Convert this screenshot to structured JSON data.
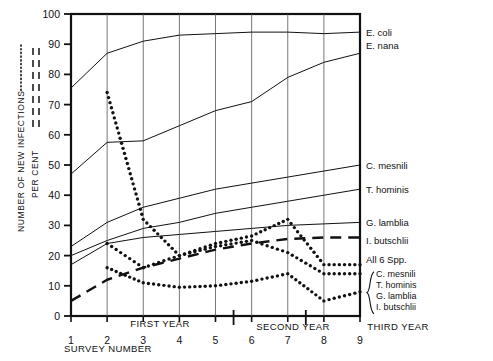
{
  "axes": {
    "y_label_primary": "NUMBER OF NEW INFECTIONS",
    "y_label_secondary": "PER CENT",
    "y_ticks": [
      "0",
      "10",
      "20",
      "30",
      "40",
      "50",
      "60",
      "70",
      "80",
      "90",
      "100"
    ],
    "x_label": "SURVEY  NUMBER",
    "x_ticks": [
      "1",
      "2",
      "3",
      "4",
      "5",
      "6",
      "7",
      "8",
      "9"
    ],
    "period_first": "FIRST  YEAR",
    "period_second": "SECOND  YEAR",
    "period_third": "THIRD  YEAR"
  },
  "right_labels": {
    "e_coli": "E. coli",
    "e_nana": "E. nana",
    "c_mesnili": "C. mesnili",
    "t_hominis": "T. hominis",
    "g_lamblia": "G. lamblia",
    "i_butschlii": "I. butschlii",
    "all_six": "All 6 Spp.",
    "bracket": [
      "C. mesnili",
      "T. hominis",
      "G. lamblia",
      "I. butschlii"
    ]
  },
  "chart_data": {
    "type": "line",
    "title": "",
    "xlabel": "SURVEY  NUMBER",
    "ylabel": "NUMBER OF NEW INFECTIONS / PER CENT",
    "xlim": [
      1,
      9
    ],
    "ylim": [
      0,
      100
    ],
    "grid": true,
    "legend_position": "right-inline",
    "x": [
      1,
      2,
      3,
      4,
      5,
      6,
      7,
      8,
      9
    ],
    "series": [
      {
        "name": "E. coli",
        "style": "solid",
        "values": [
          75.5,
          87,
          91,
          93,
          93.5,
          94,
          94,
          93.5,
          94
        ]
      },
      {
        "name": "E. nana",
        "style": "solid",
        "values": [
          47,
          57.5,
          58,
          63,
          68,
          71,
          79,
          84,
          87
        ]
      },
      {
        "name": "C. mesnili",
        "style": "solid",
        "values": [
          23,
          31,
          36,
          39,
          42,
          44,
          46,
          48,
          50
        ]
      },
      {
        "name": "T. hominis",
        "style": "solid",
        "values": [
          20,
          25,
          29,
          31,
          34,
          36,
          38,
          40,
          42
        ]
      },
      {
        "name": "G. lamblia",
        "style": "solid",
        "values": [
          17,
          24,
          26,
          27,
          28,
          29,
          30,
          30.5,
          31
        ]
      },
      {
        "name": "I. butschlii",
        "style": "dashed",
        "values": [
          5,
          12,
          16,
          19,
          22,
          24,
          25.5,
          26,
          26
        ]
      },
      {
        "name": "All 6 Spp. (new infections)",
        "style": "dotted",
        "values": [
          74,
          74,
          32,
          20,
          24,
          26.5,
          32,
          17,
          17
        ]
      },
      {
        "name": "C. mesnili / T. hominis (new infections)",
        "style": "dotted",
        "values": [
          24,
          24,
          16,
          20,
          23,
          25,
          21,
          14,
          14
        ]
      },
      {
        "name": "G. lamblia / I. butschlii (new infections)",
        "style": "dotted",
        "values": [
          16,
          16,
          11,
          9.5,
          10,
          11.5,
          14,
          5,
          8
        ]
      }
    ]
  }
}
